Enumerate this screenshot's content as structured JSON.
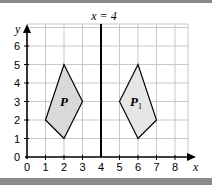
{
  "diagram": {
    "title_line_label": "x = 4",
    "x_axis_label": "x",
    "y_axis_label": "y",
    "x_ticks": [
      "0",
      "1",
      "2",
      "3",
      "4",
      "5",
      "6",
      "7",
      "8"
    ],
    "y_ticks": [
      "0",
      "1",
      "2",
      "3",
      "4",
      "5",
      "6"
    ],
    "shapes": [
      {
        "name": "P",
        "label": "P",
        "subscript": "",
        "vertices": [
          [
            1,
            2
          ],
          [
            2,
            5
          ],
          [
            3,
            3
          ],
          [
            2,
            1
          ]
        ]
      },
      {
        "name": "P1",
        "label": "P",
        "subscript": "1",
        "vertices": [
          [
            5,
            3
          ],
          [
            6,
            5
          ],
          [
            7,
            2
          ],
          [
            6,
            1
          ]
        ]
      }
    ],
    "mirror_line_x": 4,
    "colors": {
      "grid": "#c8c8c8",
      "axis": "#000000",
      "shape_fill": "#d9d9d9",
      "band": "#8a8a8a"
    }
  }
}
